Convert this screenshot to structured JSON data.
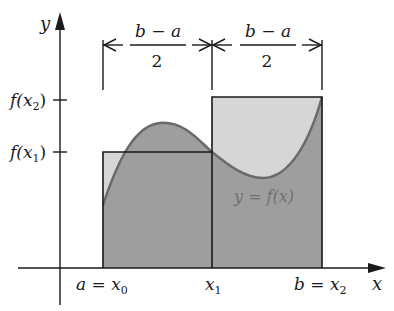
{
  "diagram": {
    "type": "midpoint-riemann-sum-illustration",
    "axes": {
      "x_label": "x",
      "y_label": "y"
    },
    "x_ticks": [
      {
        "label": "a = x",
        "sub": "0"
      },
      {
        "label": "x",
        "sub": "1"
      },
      {
        "label": "b = x",
        "sub": "2"
      }
    ],
    "y_ticks": [
      {
        "label": "f(x",
        "sub": "2",
        "close": ")"
      },
      {
        "label": "f(x",
        "sub": "1",
        "close": ")"
      }
    ],
    "dimensions": [
      {
        "numerator": "b − a",
        "denominator": "2"
      },
      {
        "numerator": "b − a",
        "denominator": "2"
      }
    ],
    "curve_label": "y = f(x)",
    "colors": {
      "rect_fill": "#d4d4d4",
      "under_curve_fill": "#9c9c9c",
      "curve_stroke": "#6e6e6e",
      "line": "#1a1a1a",
      "curve_label": "#707070"
    }
  }
}
